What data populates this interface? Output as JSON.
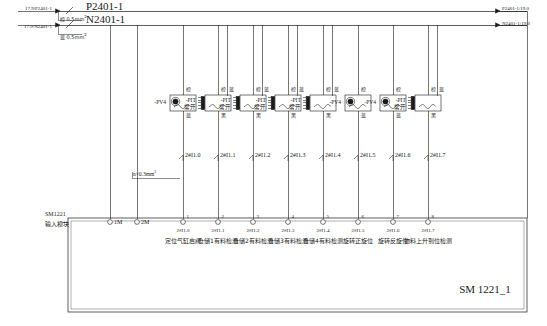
{
  "sheet": {
    "title": "SM 1221_1",
    "module_name": "SM1221",
    "module_subtitle": "输入模块"
  },
  "power": {
    "pos_source": "17.9/P2401-1",
    "neg_source": "17.9/N2401-1",
    "pos_rail": "P2401-1",
    "neg_rail": "N2401-1",
    "pos_wire_spec": "棕 0.5mm",
    "neg_wire_spec": "蓝 0.5mm",
    "wire_unit": "2",
    "pos_dest": "P2401-1/19.0",
    "neg_dest": "N2401-1/19.0",
    "bundle_spec": "n×0.3mm",
    "bundle_unit": "2"
  },
  "common_terminals": [
    {
      "name": "1M"
    },
    {
      "name": "2M"
    }
  ],
  "channels": [
    {
      "terminal": "1",
      "address": "2#I1.0",
      "description": "定位气缸启阀",
      "device_tag": "-PV4",
      "device_type": "proximity",
      "sensor_note": "",
      "top_wire": "棕",
      "bottom_wire": "蓝",
      "second_wire": ""
    },
    {
      "terminal": "2",
      "address": "2#I1.1",
      "description": "仓储1有料检测",
      "device_tag": "-PIT",
      "device_type": "magnetic",
      "sensor_note": "常开",
      "top_wire": "棕",
      "bottom_wire": "黑",
      "second_wire": "蓝"
    },
    {
      "terminal": "3",
      "address": "2#I1.2",
      "description": "仓储2有料检测",
      "device_tag": "-PIT",
      "device_type": "magnetic",
      "sensor_note": "常开",
      "top_wire": "棕",
      "bottom_wire": "黑",
      "second_wire": "蓝"
    },
    {
      "terminal": "4",
      "address": "2#I1.3",
      "description": "仓储3有料检测",
      "device_tag": "-PIT",
      "device_type": "magnetic",
      "sensor_note": "常开",
      "top_wire": "棕",
      "bottom_wire": "黑",
      "second_wire": "蓝"
    },
    {
      "terminal": "5",
      "address": "2#I1.4",
      "description": "仓储4有料检测",
      "device_tag": "-PIT",
      "device_type": "magnetic",
      "sensor_note": "常开",
      "top_wire": "棕",
      "bottom_wire": "黑",
      "second_wire": "蓝"
    },
    {
      "terminal": "6",
      "address": "2#I1.5",
      "description": "旋转正旋位",
      "device_tag": "-PV4",
      "device_type": "proximity",
      "sensor_note": "",
      "top_wire": "棕",
      "bottom_wire": "蓝",
      "second_wire": ""
    },
    {
      "terminal": "7",
      "address": "2#I1.6",
      "description": "旋转反旋位",
      "device_tag": "-PV4",
      "device_type": "proximity",
      "sensor_note": "",
      "top_wire": "棕",
      "bottom_wire": "蓝",
      "second_wire": ""
    },
    {
      "terminal": "8",
      "address": "2#I1.7",
      "description": "物料上升到位检测",
      "device_tag": "-PIT",
      "device_type": "magnetic",
      "sensor_note": "常开",
      "top_wire": "棕",
      "bottom_wire": "黑",
      "second_wire": "蓝"
    }
  ],
  "colors": {
    "line": "#1a1a1a",
    "text": "#1a1a1a",
    "background": "#ffffff"
  }
}
